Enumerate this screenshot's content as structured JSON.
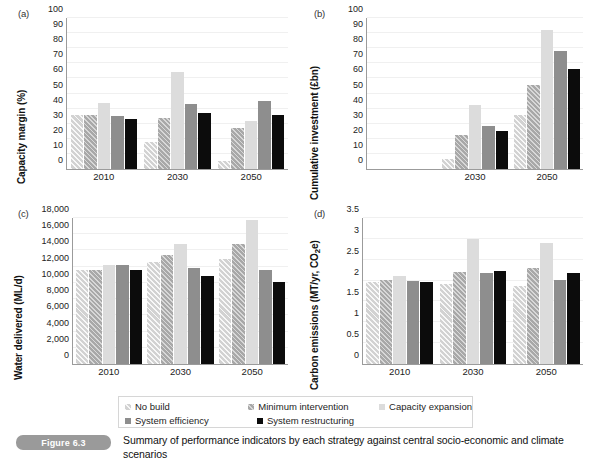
{
  "figure": {
    "badge": "Figure 6.3",
    "caption": "Summary of performance indicators by each strategy against central socio-economic and climate scenarios"
  },
  "legend": {
    "items": [
      {
        "label": "No build",
        "series": "s0",
        "swatch_color": "#d2d2d2"
      },
      {
        "label": "Minimum intervention",
        "series": "s1",
        "swatch_color": "#a8a8a8"
      },
      {
        "label": "Capacity expansion",
        "series": "s2",
        "swatch_color": "#dcdcdc"
      },
      {
        "label": "System efficiency",
        "series": "s3",
        "swatch_color": "#8e8e8e"
      },
      {
        "label": "System restructuring",
        "series": "s4",
        "swatch_color": "#0c0c0c"
      }
    ]
  },
  "panels": [
    {
      "tag": "(a)",
      "ylabel": "Capacity margin (%)"
    },
    {
      "tag": "(b)",
      "ylabel": "Cumulative investment (£bn)"
    },
    {
      "tag": "(c)",
      "ylabel": "Water delivered (ML/d)"
    },
    {
      "tag": "(d)",
      "ylabel": "Carbon emissions (MT/yr, CO₂e)"
    }
  ],
  "chart_data": [
    {
      "type": "bar",
      "panel": "(a)",
      "title": "Capacity margin",
      "xlabel": "",
      "ylabel": "Capacity margin (%)",
      "ylim": [
        0,
        100
      ],
      "yticks": [
        0,
        10,
        20,
        30,
        40,
        50,
        60,
        70,
        80,
        90,
        100
      ],
      "ytick_labels": [
        "0",
        "10",
        "20",
        "30",
        "40",
        "50",
        "60",
        "70",
        "80",
        "90",
        "100"
      ],
      "grid": true,
      "legend_position": "below-figure",
      "categories": [
        "2010",
        "2030",
        "2050"
      ],
      "series": [
        {
          "name": "No build",
          "values": [
            36,
            18,
            5
          ]
        },
        {
          "name": "Minimum intervention",
          "values": [
            36,
            34,
            27
          ]
        },
        {
          "name": "Capacity expansion",
          "values": [
            44,
            64,
            32
          ]
        },
        {
          "name": "System efficiency",
          "values": [
            35,
            43,
            45
          ]
        },
        {
          "name": "System restructuring",
          "values": [
            33,
            37,
            36
          ]
        }
      ]
    },
    {
      "type": "bar",
      "panel": "(b)",
      "title": "Cumulative investment",
      "xlabel": "",
      "ylabel": "Cumulative investment (£bn)",
      "ylim": [
        0,
        100
      ],
      "yticks": [
        0,
        10,
        20,
        30,
        40,
        50,
        60,
        70,
        80,
        90,
        100
      ],
      "ytick_labels": [
        "0",
        "10",
        "20",
        "30",
        "40",
        "50",
        "60",
        "70",
        "80",
        "90",
        "100"
      ],
      "grid": true,
      "legend_position": "below-figure",
      "categories": [
        "2030",
        "2050"
      ],
      "series": [
        {
          "name": "No build",
          "values": [
            6.5,
            35.5
          ]
        },
        {
          "name": "Minimum intervention",
          "values": [
            22.8,
            55.5
          ]
        },
        {
          "name": "Capacity expansion",
          "values": [
            42.3,
            92
          ]
        },
        {
          "name": "System efficiency",
          "values": [
            28.5,
            78.3
          ]
        },
        {
          "name": "System restructuring",
          "values": [
            25,
            66
          ]
        }
      ]
    },
    {
      "type": "bar",
      "panel": "(c)",
      "title": "Water delivered",
      "xlabel": "",
      "ylabel": "Water delivered (ML/d)",
      "ylim": [
        0,
        18000
      ],
      "yticks": [
        0,
        2000,
        4000,
        6000,
        8000,
        10000,
        12000,
        14000,
        16000,
        18000
      ],
      "ytick_labels": [
        "0",
        "2,000",
        "4,000",
        "6,000",
        "8,000",
        "10,000",
        "12,000",
        "14,000",
        "16,000",
        "18,000"
      ],
      "grid": true,
      "legend_position": "below-figure",
      "categories": [
        "2010",
        "2030",
        "2050"
      ],
      "series": [
        {
          "name": "No build",
          "values": [
            11550,
            12600,
            12900
          ]
        },
        {
          "name": "Minimum intervention",
          "values": [
            11650,
            13400,
            14750
          ]
        },
        {
          "name": "Capacity expansion",
          "values": [
            12250,
            14850,
            17800
          ]
        },
        {
          "name": "System efficiency",
          "values": [
            12200,
            11850,
            11550
          ]
        },
        {
          "name": "System restructuring",
          "values": [
            11650,
            10850,
            10050
          ]
        }
      ]
    },
    {
      "type": "bar",
      "panel": "(d)",
      "title": "Carbon emissions",
      "xlabel": "",
      "ylabel": "Carbon emissions (MT/yr, CO₂e)",
      "ylim": [
        0,
        3.5
      ],
      "yticks": [
        0,
        0.5,
        1,
        1.5,
        2,
        2.5,
        3,
        3.5
      ],
      "ytick_labels": [
        "0",
        "0.5",
        "1",
        "1.5",
        "2",
        "2.5",
        "3",
        "3.5"
      ],
      "grid": true,
      "legend_position": "below-figure",
      "categories": [
        "2010",
        "2030",
        "2050"
      ],
      "series": [
        {
          "name": "No build",
          "values": [
            1.97,
            1.91,
            1.87
          ]
        },
        {
          "name": "Minimum intervention",
          "values": [
            2.01,
            2.2,
            2.29
          ]
        },
        {
          "name": "Capacity expansion",
          "values": [
            2.12,
            3.0,
            2.91
          ]
        },
        {
          "name": "System efficiency",
          "values": [
            1.98,
            2.19,
            2.02
          ]
        },
        {
          "name": "System restructuring",
          "values": [
            1.97,
            2.22,
            2.18
          ]
        }
      ]
    }
  ]
}
